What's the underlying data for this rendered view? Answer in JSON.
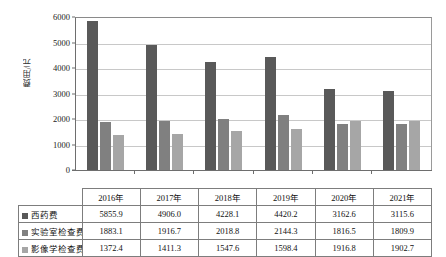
{
  "chart_data": {
    "type": "bar",
    "title": "",
    "xlabel": "",
    "ylabel": "费用/元",
    "ylim": [
      0,
      6000
    ],
    "ytick_step": 1000,
    "yticks": [
      "0",
      "1000",
      "2000",
      "3000",
      "4000",
      "5000",
      "6000"
    ],
    "grid": true,
    "legend_position": "table-row-headers",
    "categories": [
      "2016年",
      "2017年",
      "2018年",
      "2019年",
      "2020年",
      "2021年"
    ],
    "series": [
      {
        "name": "西药费",
        "color": "#595959",
        "values": [
          5855.9,
          4906.0,
          4228.1,
          4420.2,
          3162.6,
          3115.6
        ],
        "value_labels": [
          "5855.9",
          "4906.0",
          "4228.1",
          "4420.2",
          "3162.6",
          "3115.6"
        ]
      },
      {
        "name": "实验室检查费",
        "color": "#808080",
        "values": [
          1883.1,
          1916.7,
          2018.8,
          2144.3,
          1816.5,
          1809.9
        ],
        "value_labels": [
          "1883.1",
          "1916.7",
          "2018.8",
          "2144.3",
          "1816.5",
          "1809.9"
        ]
      },
      {
        "name": "影像学检查费",
        "color": "#a6a6a6",
        "values": [
          1372.4,
          1411.3,
          1547.6,
          1598.4,
          1916.8,
          1902.7
        ],
        "value_labels": [
          "1372.4",
          "1411.3",
          "1547.6",
          "1598.4",
          "1916.8",
          "1902.7"
        ]
      }
    ]
  },
  "table": {
    "corner_label": "",
    "column_headers": [
      "2016年",
      "2017年",
      "2018年",
      "2019年",
      "2020年",
      "2021年"
    ],
    "rows": [
      {
        "label": "西药费",
        "swatch_color": "#595959",
        "cells": [
          "5855.9",
          "4906.0",
          "4228.1",
          "4420.2",
          "3162.6",
          "3115.6"
        ]
      },
      {
        "label": "实验室检查费",
        "swatch_color": "#808080",
        "cells": [
          "1883.1",
          "1916.7",
          "2018.8",
          "2144.3",
          "1816.5",
          "1809.9"
        ]
      },
      {
        "label": "影像学检查费",
        "swatch_color": "#a6a6a6",
        "cells": [
          "1372.4",
          "1411.3",
          "1547.6",
          "1598.4",
          "1916.8",
          "1902.7"
        ]
      }
    ]
  },
  "colors": {
    "series_1": "#595959",
    "series_2": "#808080",
    "series_3": "#a6a6a6",
    "gridline": "#c8c8c8",
    "axis": "#6e6e6e",
    "table_border": "#7d7d7d",
    "background": "#ffffff"
  }
}
